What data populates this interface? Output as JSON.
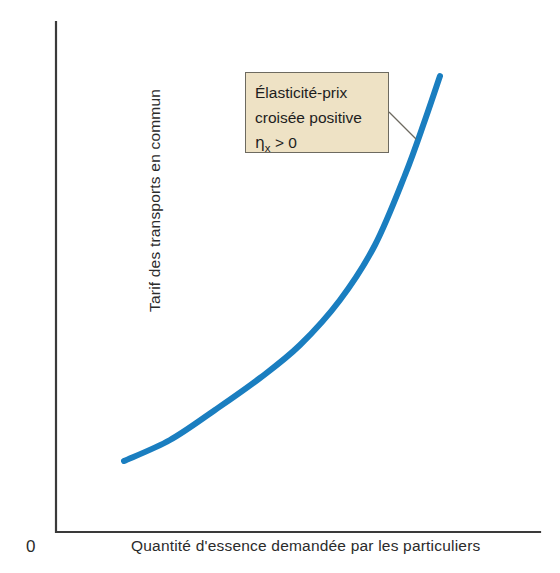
{
  "chart_data": {
    "type": "line",
    "title": "",
    "subtitle": "",
    "xlabel": "Quantité d'essence demandée par les particuliers",
    "ylabel": "Tarif des transports en commun",
    "origin_label": "0",
    "grid": false,
    "legend": null,
    "axis_ticks": {
      "x": [],
      "y": []
    },
    "xlim": [
      0,
      1
    ],
    "ylim": [
      0,
      1
    ],
    "series": [
      {
        "name": "Élasticité-prix croisée positive",
        "color": "#1a7ec0",
        "line_width_px": 6,
        "shape": "convex-increasing",
        "points_norm": [
          {
            "x": 0.14,
            "y": 0.14
          },
          {
            "x": 0.26,
            "y": 0.21
          },
          {
            "x": 0.38,
            "y": 0.3
          },
          {
            "x": 0.5,
            "y": 0.41
          },
          {
            "x": 0.62,
            "y": 0.54
          },
          {
            "x": 0.72,
            "y": 0.68
          },
          {
            "x": 0.79,
            "y": 0.82
          },
          {
            "x": 0.83,
            "y": 0.93
          },
          {
            "x": 0.85,
            "y": 1.0
          }
        ],
        "points_px": [
          {
            "x": 124,
            "y": 461
          },
          {
            "x": 170,
            "y": 440
          },
          {
            "x": 215,
            "y": 410
          },
          {
            "x": 260,
            "y": 378
          },
          {
            "x": 300,
            "y": 345
          },
          {
            "x": 340,
            "y": 300
          },
          {
            "x": 375,
            "y": 245
          },
          {
            "x": 405,
            "y": 175
          },
          {
            "x": 425,
            "y": 120
          },
          {
            "x": 440,
            "y": 76
          }
        ]
      }
    ],
    "annotations": [
      {
        "id": "elasticity-note",
        "lines": [
          "Élasticité-prix",
          "croisée positive"
        ],
        "symbol": "η",
        "subscript": "x",
        "relation": "> 0",
        "box_fill": "#eee2c5",
        "box_border": "#6d6a60",
        "leader_from_px": {
          "x": 389,
          "y": 112
        },
        "leader_to_px": {
          "x": 416,
          "y": 139
        }
      }
    ],
    "axes_style": {
      "color": "#3a3a3a",
      "width_px": 2.2,
      "spines": [
        "left",
        "bottom"
      ]
    },
    "background": "#ffffff"
  },
  "colors": {
    "curve": "#1a7ec0",
    "axis": "#3a3a3a",
    "annotation_fill": "#eee2c5",
    "annotation_border": "#6d6a60",
    "leader_line": "#6d6a60",
    "text": "#1d1d1d",
    "background": "#ffffff"
  }
}
